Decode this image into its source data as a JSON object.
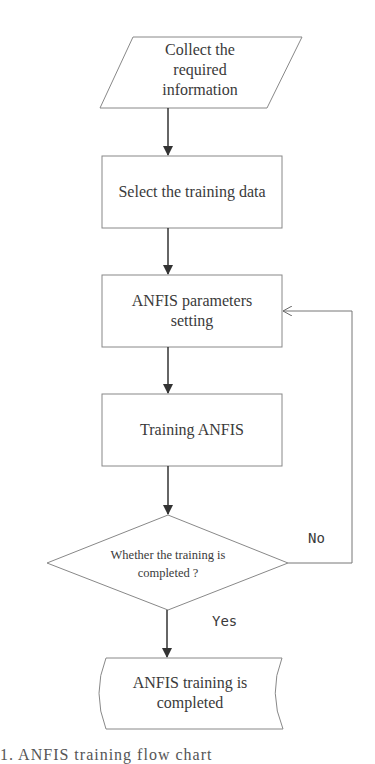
{
  "diagram": {
    "nodes": [
      {
        "id": "collect",
        "shape": "parallelogram",
        "text_lines": [
          "Collect the",
          "required",
          "information"
        ]
      },
      {
        "id": "select",
        "shape": "rectangle",
        "text_lines": [
          "Select the training data"
        ]
      },
      {
        "id": "params",
        "shape": "rectangle",
        "text_lines": [
          "ANFIS parameters",
          "setting"
        ]
      },
      {
        "id": "train",
        "shape": "rectangle",
        "text_lines": [
          "Training ANFIS"
        ]
      },
      {
        "id": "decision",
        "shape": "diamond",
        "text_lines": [
          "Whether the training is",
          "completed ?"
        ]
      },
      {
        "id": "done",
        "shape": "curved-rectangle",
        "text_lines": [
          "ANFIS training is",
          "completed"
        ]
      }
    ],
    "edges": [
      {
        "from": "collect",
        "to": "select",
        "label": ""
      },
      {
        "from": "select",
        "to": "params",
        "label": ""
      },
      {
        "from": "params",
        "to": "train",
        "label": ""
      },
      {
        "from": "train",
        "to": "decision",
        "label": ""
      },
      {
        "from": "decision",
        "to": "params",
        "label": "No"
      },
      {
        "from": "decision",
        "to": "done",
        "label": "Yes"
      }
    ],
    "edge_labels": {
      "no": "No",
      "yes": "Yes"
    },
    "caption": "1.  ANFIS training flow chart"
  }
}
